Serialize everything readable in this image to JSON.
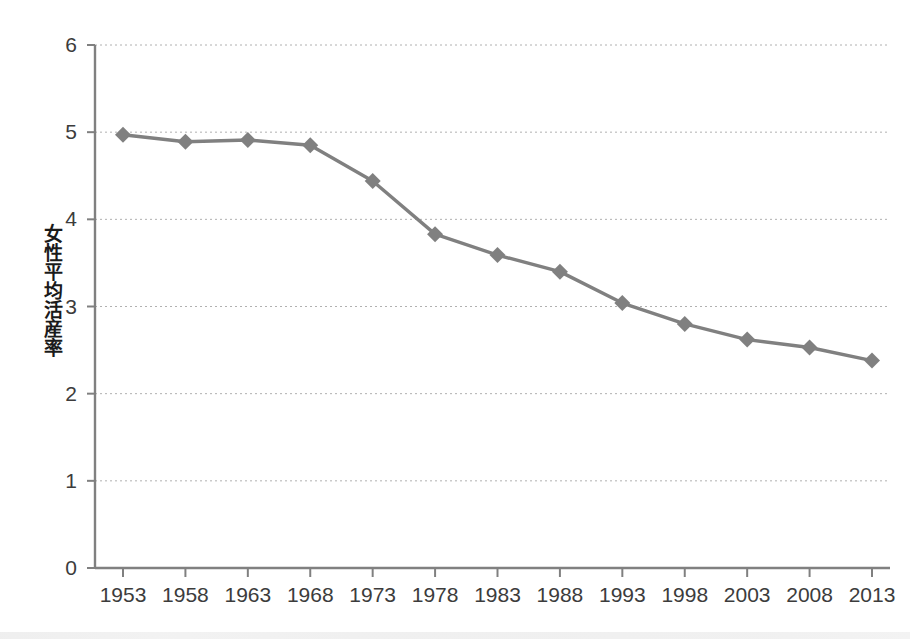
{
  "chart_data": {
    "type": "line",
    "title": "",
    "xlabel": "",
    "ylabel": "女性平均活産率",
    "categories": [
      "1953",
      "1958",
      "1963",
      "1968",
      "1973",
      "1978",
      "1983",
      "1988",
      "1993",
      "1998",
      "2003",
      "2008",
      "2013"
    ],
    "x": [
      1953,
      1958,
      1963,
      1968,
      1973,
      1978,
      1983,
      1988,
      1993,
      1998,
      2003,
      2008,
      2013
    ],
    "values": [
      4.97,
      4.89,
      4.91,
      4.85,
      4.44,
      3.83,
      3.59,
      3.4,
      3.04,
      2.8,
      2.62,
      2.53,
      2.38
    ],
    "series": [
      {
        "name": "女性平均活産率",
        "values": [
          4.97,
          4.89,
          4.91,
          4.85,
          4.44,
          3.83,
          3.59,
          3.4,
          3.04,
          2.8,
          2.62,
          2.53,
          2.38
        ],
        "color": "#808080",
        "marker": "diamond"
      }
    ],
    "ylim": [
      0,
      6
    ],
    "yticks": [
      0,
      1,
      2,
      3,
      4,
      5,
      6
    ],
    "ytick_labels": [
      "0",
      "1",
      "2",
      "3",
      "4",
      "5",
      "6"
    ],
    "grid": true,
    "grid_axis": "y",
    "grid_style": "dotted",
    "grid_color": "#b0b0b0",
    "legend": false,
    "legend_position": "none",
    "axis_color": "#808080",
    "background": "#ffffff"
  }
}
